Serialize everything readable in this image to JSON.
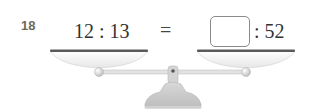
{
  "problem": {
    "number": "18",
    "left_ratio": "12 : 13",
    "equals": "=",
    "answer_box_value": "",
    "right_ratio": ": 52"
  },
  "illustration": {
    "type": "balance-scale",
    "colors": {
      "pan_rim": "#555555",
      "pan_fill": "#f4f4f4",
      "beam": "#dcdcdc",
      "base": "#c8c8c8"
    }
  }
}
